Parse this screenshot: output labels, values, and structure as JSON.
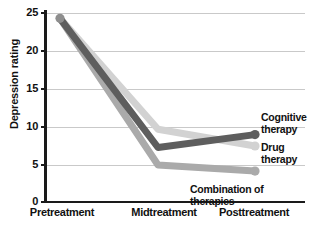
{
  "chart_data": {
    "type": "line",
    "title": "",
    "xlabel": "",
    "ylabel": "Depression rating",
    "categories": [
      "Pretreatment",
      "Midtreatment",
      "Posttreatment"
    ],
    "ylim": [
      0,
      25
    ],
    "yticks": [
      0,
      5,
      10,
      15,
      20,
      25
    ],
    "grid": "horizontal",
    "legend_position": "inline-right",
    "series": [
      {
        "name": "Cognitive therapy",
        "label_lines": [
          "Cognitive",
          "therapy"
        ],
        "color": "#5e5e5e",
        "values": [
          24.3,
          7.3,
          9.0
        ]
      },
      {
        "name": "Drug therapy",
        "label_lines": [
          "Drug",
          "therapy"
        ],
        "color": "#d2d2d2",
        "values": [
          24.3,
          9.7,
          7.5
        ]
      },
      {
        "name": "Combination of therapies",
        "label_lines": [
          "Combination of therapies"
        ],
        "color": "#aaaaaa",
        "values": [
          24.3,
          5.0,
          4.2
        ]
      }
    ]
  },
  "axes": {
    "y_title": "Depression rating",
    "y_tick_labels": [
      "25",
      "20",
      "15",
      "10",
      "5",
      "0"
    ],
    "x_tick_labels": [
      "Pretreatment",
      "Midtreatment",
      "Posttreatment"
    ]
  },
  "annotations": {
    "cognitive_line1": "Cognitive",
    "cognitive_line2": "therapy",
    "drug_line1": "Drug",
    "drug_line2": "therapy",
    "combination": "Combination of therapies"
  },
  "colors": {
    "axis": "#1a1a1a",
    "grid": "#c9c9c9",
    "cognitive": "#5e5e5e",
    "drug": "#d2d2d2",
    "combination": "#aaaaaa",
    "background": "#ffffff"
  }
}
